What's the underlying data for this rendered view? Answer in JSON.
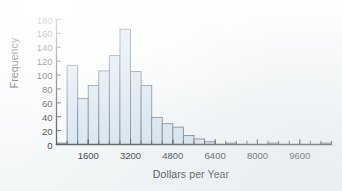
{
  "chart_data": {
    "type": "bar",
    "title": "",
    "subtitle": "",
    "xlabel": "Dollars per Year",
    "ylabel": "Frequency",
    "grid": false,
    "legend": null,
    "xlim": [
      400,
      10800
    ],
    "ylim": [
      0,
      180
    ],
    "bin_width": 400,
    "yticks": [
      0,
      20,
      40,
      60,
      80,
      100,
      120,
      140,
      160,
      180
    ],
    "xticks": [
      1600,
      3200,
      4800,
      6400,
      8000,
      9600
    ],
    "xtick_labels": [
      "1600",
      "3200",
      "4800",
      "6400",
      "8000",
      "9600"
    ],
    "ytick_labels": [
      "0",
      "20",
      "40",
      "60",
      "80",
      "100",
      "120",
      "140",
      "160",
      "180"
    ],
    "bin_starts": [
      400,
      800,
      1200,
      1600,
      2000,
      2400,
      2800,
      3200,
      3600,
      4000,
      4400,
      4800,
      5200,
      5600,
      6000,
      6400,
      6800,
      7200,
      7600,
      8000,
      8400,
      8800,
      9200,
      9600,
      10000,
      10400
    ],
    "categories": [
      "400-800",
      "800-1200",
      "1200-1600",
      "1600-2000",
      "2000-2400",
      "2400-2800",
      "2800-3200",
      "3200-3600",
      "3600-4000",
      "4000-4400",
      "4400-4800",
      "4800-5200",
      "5200-5600",
      "5600-6000",
      "6000-6400",
      "6400-6800",
      "6800-7200",
      "7200-7600",
      "7600-8000",
      "8000-8400",
      "8400-8800",
      "8800-9200",
      "9200-9600",
      "9600-10000",
      "10000-10400",
      "10400-10800"
    ],
    "values": [
      2,
      114,
      66,
      85,
      106,
      128,
      166,
      105,
      85,
      39,
      30,
      25,
      13,
      8,
      4,
      0,
      2,
      0,
      0,
      0,
      2,
      0,
      0,
      0,
      0,
      2
    ],
    "colors": {
      "bar_fill": "#d6e3ef",
      "bar_edge": "#5d6f80",
      "axis": "#454545",
      "text": "#2b2b2b",
      "background": "#fbfcfc"
    }
  }
}
